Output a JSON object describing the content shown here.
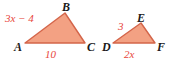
{
  "figure": {
    "background_color": "#ffffff",
    "fill_color": "#f3a183",
    "stroke_color": "#d4654a",
    "measure_color": "#e8463c",
    "vertex_color": "#1a1a1a"
  },
  "triangles": [
    {
      "name": "triangle-ABC",
      "vertices": [
        {
          "label": "A",
          "x": 25,
          "y": 43
        },
        {
          "label": "B",
          "x": 65,
          "y": 13
        },
        {
          "label": "C",
          "x": 85,
          "y": 43
        }
      ],
      "side_labels": [
        {
          "id": "ab",
          "side": "AB",
          "text": "3x − 4"
        },
        {
          "id": "ac",
          "side": "AC",
          "text": "10"
        }
      ]
    },
    {
      "name": "triangle-DEF",
      "vertices": [
        {
          "label": "D",
          "x": 113,
          "y": 43
        },
        {
          "label": "E",
          "x": 141,
          "y": 23
        },
        {
          "label": "F",
          "x": 155,
          "y": 43
        }
      ],
      "side_labels": [
        {
          "id": "de",
          "side": "DE",
          "text": "3"
        },
        {
          "id": "df",
          "side": "DF",
          "text": "2x"
        }
      ]
    }
  ]
}
